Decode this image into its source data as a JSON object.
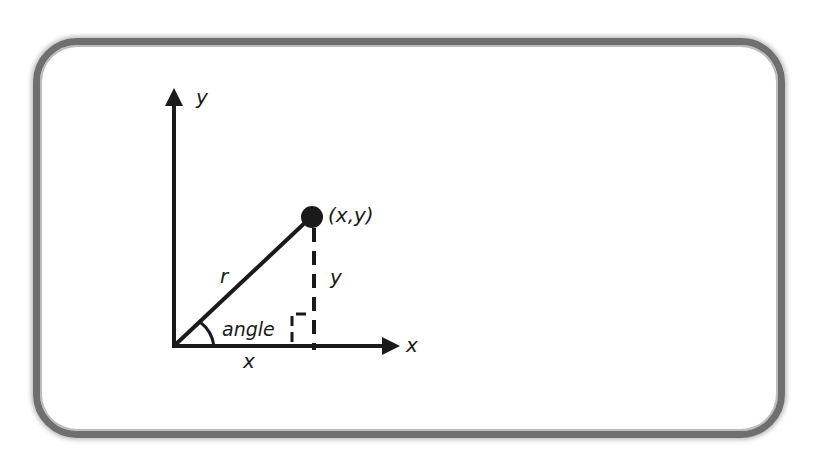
{
  "diagram": {
    "type": "polar-coordinates",
    "labels": {
      "y_axis": "y",
      "x_axis": "x",
      "point": "(x,y)",
      "radius": "r",
      "y_component": "y",
      "x_component": "x",
      "angle": "angle"
    },
    "colors": {
      "stroke": "#1a1a1a",
      "frame": "#6f6f6f",
      "background": "#ffffff"
    }
  }
}
